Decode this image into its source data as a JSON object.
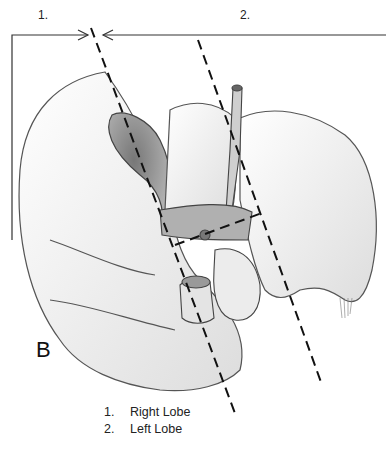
{
  "figure": {
    "panel_label": "B",
    "division_labels": [
      "1.",
      "2."
    ],
    "legend": [
      {
        "num": "1.",
        "text": "Right Lobe"
      },
      {
        "num": "2.",
        "text": "Left Lobe"
      }
    ],
    "colors": {
      "line": "#222222",
      "shade": "#9a9a9a",
      "background": "#ffffff"
    }
  }
}
